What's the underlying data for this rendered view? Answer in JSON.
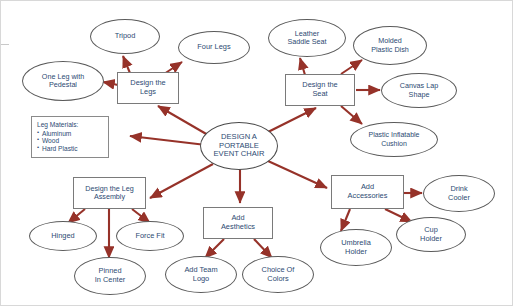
{
  "diagram": {
    "type": "mind-map",
    "edge_color": "#963229",
    "text_color": "#2c4a72",
    "node_border_color": "#5a5a5a",
    "background": "#ffffff",
    "nodes": {
      "center": {
        "label": "DESIGN A\nPORTABLE\nEVENT CHAIR",
        "line1": "DESIGN A",
        "line2": "PORTABLE",
        "line3": "EVENT CHAIR",
        "shape": "ellipse"
      },
      "design_legs": {
        "label": "Design the\nLegs",
        "line1": "Design the",
        "line2": "Legs",
        "shape": "box"
      },
      "tripod": {
        "label": "Tripod",
        "shape": "ellipse"
      },
      "four_legs": {
        "label": "Four Legs",
        "shape": "ellipse"
      },
      "one_leg_pedestal": {
        "label": "One Leg with\nPedestal",
        "line1": "One Leg with",
        "line2": "Pedestal",
        "shape": "ellipse"
      },
      "leg_materials": {
        "title": "Leg Materials:",
        "items": [
          "Aluminum",
          "Wood",
          "Hard Plastic"
        ],
        "shape": "box"
      },
      "design_seat": {
        "label": "Design the\nSeat",
        "line1": "Design the",
        "line2": "Seat",
        "shape": "box"
      },
      "leather_saddle_seat": {
        "label": "Leather\nSaddle Seat",
        "line1": "Leather",
        "line2": "Saddle Seat",
        "shape": "ellipse"
      },
      "molded_plastic_dish": {
        "label": "Molded\nPlastic Dish",
        "line1": "Molded",
        "line2": "Plastic Dish",
        "shape": "ellipse"
      },
      "canvas_lap_shape": {
        "label": "Canvas Lap\nShape",
        "line1": "Canvas Lap",
        "line2": "Shape",
        "shape": "ellipse"
      },
      "plastic_inflatable_cushion": {
        "label": "Plastic Inflatable\nCushion",
        "line1": "Plastic Inflatable",
        "line2": "Cushion",
        "shape": "ellipse"
      },
      "design_leg_assembly": {
        "label": "Design the Leg\nAssembly",
        "line1": "Design the Leg",
        "line2": "Assembly",
        "shape": "box"
      },
      "hinged": {
        "label": "Hinged",
        "shape": "ellipse"
      },
      "force_fit": {
        "label": "Force Fit",
        "shape": "ellipse"
      },
      "pinned_in_center": {
        "label": "Pinned\nIn Center",
        "line1": "Pinned",
        "line2": "In Center",
        "shape": "ellipse"
      },
      "add_aesthetics": {
        "label": "Add\nAesthetics",
        "line1": "Add",
        "line2": "Aesthetics",
        "shape": "box"
      },
      "add_team_logo": {
        "label": "Add Team\nLogo",
        "line1": "Add Team",
        "line2": "Logo",
        "shape": "ellipse"
      },
      "choice_of_colors": {
        "label": "Choice Of\nColors",
        "line1": "Choice Of",
        "line2": "Colors",
        "shape": "ellipse"
      },
      "add_accessories": {
        "label": "Add\nAccessories",
        "line1": "Add",
        "line2": "Accessories",
        "shape": "box"
      },
      "drink_cooler": {
        "label": "Drink\nCooler",
        "line1": "Drink",
        "line2": "Cooler",
        "shape": "ellipse"
      },
      "cup_holder": {
        "label": "Cup\nHolder",
        "line1": "Cup",
        "line2": "Holder",
        "shape": "ellipse"
      },
      "umbrella_holder": {
        "label": "Umbrella\nHolder",
        "line1": "Umbrella",
        "line2": "Holder",
        "shape": "ellipse"
      }
    },
    "edges": [
      {
        "from": "center",
        "to": "design_legs"
      },
      {
        "from": "center",
        "to": "design_seat"
      },
      {
        "from": "center",
        "to": "leg_materials"
      },
      {
        "from": "center",
        "to": "design_leg_assembly"
      },
      {
        "from": "center",
        "to": "add_aesthetics"
      },
      {
        "from": "center",
        "to": "add_accessories"
      },
      {
        "from": "design_legs",
        "to": "tripod"
      },
      {
        "from": "design_legs",
        "to": "four_legs"
      },
      {
        "from": "design_legs",
        "to": "one_leg_pedestal"
      },
      {
        "from": "design_seat",
        "to": "leather_saddle_seat"
      },
      {
        "from": "design_seat",
        "to": "molded_plastic_dish"
      },
      {
        "from": "design_seat",
        "to": "canvas_lap_shape"
      },
      {
        "from": "design_seat",
        "to": "plastic_inflatable_cushion"
      },
      {
        "from": "design_leg_assembly",
        "to": "hinged"
      },
      {
        "from": "design_leg_assembly",
        "to": "force_fit"
      },
      {
        "from": "design_leg_assembly",
        "to": "pinned_in_center"
      },
      {
        "from": "add_aesthetics",
        "to": "add_team_logo"
      },
      {
        "from": "add_aesthetics",
        "to": "choice_of_colors"
      },
      {
        "from": "add_accessories",
        "to": "drink_cooler"
      },
      {
        "from": "add_accessories",
        "to": "cup_holder"
      },
      {
        "from": "add_accessories",
        "to": "umbrella_holder"
      }
    ]
  }
}
